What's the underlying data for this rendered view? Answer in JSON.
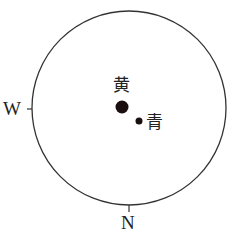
{
  "diagram": {
    "type": "celestial-sky-map",
    "horizon_circle": {
      "cx": 129,
      "cy": 108,
      "r": 97,
      "stroke": "#333333"
    },
    "directions": {
      "west": {
        "label": "W"
      },
      "north": {
        "label": "N"
      }
    },
    "points": [
      {
        "id": "huang",
        "label": "黄",
        "meaning": "ecliptic pole / yellow",
        "cx": 122,
        "cy": 107,
        "r": 6.5,
        "color": "#1a0e0e"
      },
      {
        "id": "qing",
        "label": "青",
        "meaning": "blue / cyan",
        "cx": 139,
        "cy": 121,
        "r": 3.5,
        "color": "#1a0e0e"
      }
    ]
  }
}
